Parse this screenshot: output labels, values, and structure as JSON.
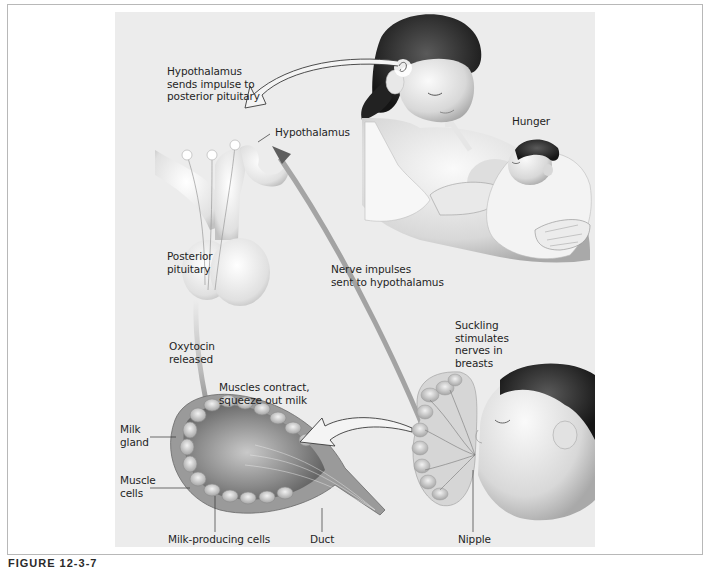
{
  "figure": {
    "caption": "FIGURE 12-3-7",
    "colors": {
      "panel": "#ececec",
      "frame_border": "#b8b8b8",
      "arrow_dark": "#6e6e6e",
      "arrow_outline": "#3a3a3a",
      "text": "#1f1f1f"
    }
  },
  "labels": {
    "hypothalamus_sends": "Hypothalamus\nsends impulse to\nposterior pituitary",
    "hypothalamus": "Hypothalamus",
    "hunger": "Hunger",
    "posterior_pituitary": "Posterior\npituitary",
    "nerve_impulses": "Nerve impulses\nsent to hypothalamus",
    "oxytocin_released": "Oxytocin\nreleased",
    "suckling": "Suckling\nstimulates\nnerves in\nbreasts",
    "muscles_contract": "Muscles contract,\nsqueeze out milk",
    "milk_gland": "Milk\ngland",
    "muscle_cells": "Muscle\ncells",
    "milk_producing_cells": "Milk-producing cells",
    "duct": "Duct",
    "nipple": "Nipple"
  }
}
